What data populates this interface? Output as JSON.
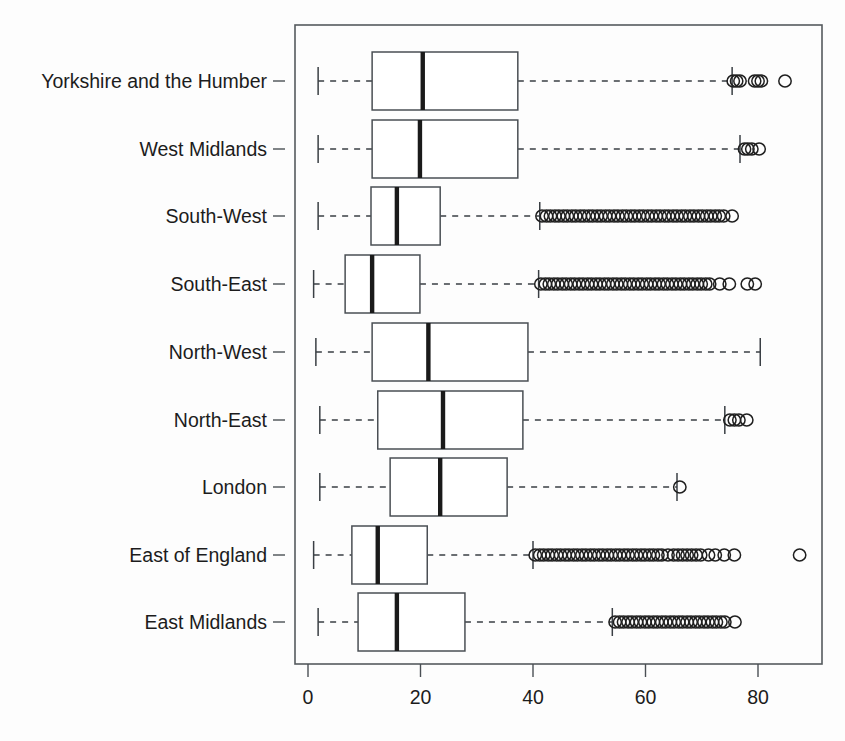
{
  "chart_data": {
    "type": "box",
    "title": "",
    "xlabel": "",
    "ylabel": "",
    "orientation": "horizontal",
    "xlim": [
      -2,
      91
    ],
    "xticks": [
      0,
      20,
      40,
      60,
      80
    ],
    "xtick_labels": [
      "0",
      "20",
      "40",
      "60",
      "80"
    ],
    "grid": false,
    "legend": null,
    "categories": [
      "Yorkshire and the Humber",
      "West Midlands",
      "South-West",
      "South-East",
      "North-West",
      "North-East",
      "London",
      "East of England",
      "East Midlands"
    ],
    "boxes": [
      {
        "category": "Yorkshire and the Humber",
        "whisker_low": 1.8,
        "q1": 11.4,
        "median": 20.4,
        "q3": 37.3,
        "whisker_high": 75.4,
        "outliers": [
          75.6,
          76.2,
          76.8,
          79.4,
          80.0,
          80.6,
          84.8
        ]
      },
      {
        "category": "West Midlands",
        "whisker_low": 1.8,
        "q1": 11.4,
        "median": 19.9,
        "q3": 37.3,
        "whisker_high": 76.8,
        "outliers": [
          77.6,
          78.2,
          78.9,
          80.2
        ]
      },
      {
        "category": "South-West",
        "whisker_low": 1.8,
        "q1": 11.2,
        "median": 15.8,
        "q3": 23.5,
        "whisker_high": 41.2,
        "outliers": [
          41.6,
          42.4,
          43.1,
          43.9,
          44.6,
          45.4,
          46.1,
          46.9,
          47.6,
          48.4,
          49.1,
          49.9,
          50.6,
          51.4,
          52.1,
          52.9,
          53.6,
          54.4,
          55.1,
          55.9,
          56.6,
          57.4,
          58.1,
          58.9,
          59.6,
          60.4,
          61.1,
          61.9,
          62.6,
          63.4,
          64.1,
          64.9,
          65.6,
          66.4,
          67.1,
          67.9,
          68.6,
          69.4,
          70.1,
          70.9,
          71.6,
          72.4,
          73.1,
          73.9,
          75.4
        ]
      },
      {
        "category": "South-East",
        "whisker_low": 1.0,
        "q1": 6.6,
        "median": 11.4,
        "q3": 19.9,
        "whisker_high": 41.0,
        "outliers": [
          41.4,
          42.2,
          42.9,
          43.7,
          44.4,
          45.2,
          45.9,
          46.7,
          47.4,
          48.2,
          48.9,
          49.7,
          50.4,
          51.2,
          51.9,
          52.7,
          53.4,
          54.2,
          54.9,
          55.7,
          56.4,
          57.2,
          57.9,
          58.7,
          59.4,
          60.2,
          60.9,
          61.7,
          62.4,
          63.2,
          63.9,
          64.7,
          65.4,
          66.2,
          66.9,
          67.7,
          68.4,
          69.2,
          69.9,
          70.7,
          71.4,
          73.2,
          74.9,
          78.1,
          79.5
        ]
      },
      {
        "category": "North-West",
        "whisker_low": 1.4,
        "q1": 11.4,
        "median": 21.4,
        "q3": 39.1,
        "whisker_high": 80.4,
        "outliers": []
      },
      {
        "category": "North-East",
        "whisker_low": 2.1,
        "q1": 12.4,
        "median": 24.0,
        "q3": 38.2,
        "whisker_high": 74.1,
        "outliers": [
          75.0,
          75.8,
          76.6,
          78.0
        ]
      },
      {
        "category": "London",
        "whisker_low": 2.1,
        "q1": 14.6,
        "median": 23.5,
        "q3": 35.4,
        "whisker_high": 65.6,
        "outliers": [
          66.1
        ]
      },
      {
        "category": "East of England",
        "whisker_low": 1.0,
        "q1": 7.8,
        "median": 12.4,
        "q3": 21.2,
        "whisker_high": 40.0,
        "outliers": [
          40.4,
          41.2,
          41.9,
          42.7,
          43.4,
          44.2,
          44.9,
          45.7,
          46.4,
          47.2,
          47.9,
          48.7,
          49.4,
          50.2,
          50.9,
          51.7,
          52.4,
          53.2,
          53.9,
          54.7,
          55.4,
          56.2,
          56.9,
          57.7,
          58.4,
          59.2,
          59.9,
          60.7,
          61.4,
          62.2,
          62.9,
          64.0,
          65.0,
          65.8,
          66.6,
          67.4,
          68.2,
          69.0,
          69.8,
          71.2,
          72.4,
          74.0,
          75.8,
          87.4
        ]
      },
      {
        "category": "East Midlands",
        "whisker_low": 1.8,
        "q1": 8.9,
        "median": 15.8,
        "q3": 27.9,
        "whisker_high": 54.1,
        "outliers": [
          54.6,
          55.4,
          56.1,
          56.9,
          57.6,
          58.4,
          59.1,
          59.9,
          60.6,
          61.4,
          62.1,
          62.9,
          63.6,
          64.4,
          65.1,
          65.9,
          66.6,
          67.4,
          68.1,
          68.9,
          69.6,
          70.4,
          71.1,
          71.9,
          72.6,
          73.4,
          74.1,
          75.9
        ]
      }
    ]
  },
  "colors": {
    "frame": "#555a5e",
    "box_stroke": "#4a4f54",
    "median": "#1a1a1a",
    "whisker": "#3a3f44",
    "outlier": "#1f1f1f",
    "text": "#1c1c1c",
    "background": "#fdfdfd"
  }
}
